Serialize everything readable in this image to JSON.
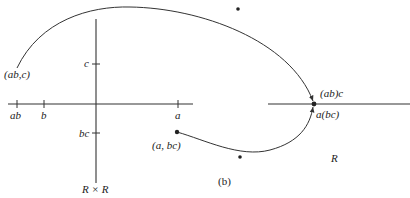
{
  "figure": {
    "caption": "(b)",
    "product_space_label": "R × R",
    "real_line_label": "R"
  },
  "left_axes": {
    "x_ticks": [
      {
        "label": "ab"
      },
      {
        "label": "b"
      },
      {
        "label": "a"
      }
    ],
    "y_ticks": [
      {
        "label": "c"
      },
      {
        "label": "bc"
      }
    ]
  },
  "points": {
    "ab_c": "(ab,c)",
    "a_bc": "(a, bc)",
    "ab_c_image": "(ab)c",
    "a_bc_image": "a(bc)"
  },
  "colors": {
    "line": "#333333",
    "text": "#222222",
    "background": "#ffffff"
  }
}
